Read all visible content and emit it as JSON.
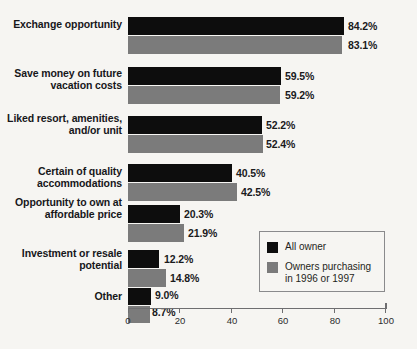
{
  "chart_data": {
    "type": "bar",
    "orientation": "horizontal",
    "title": "",
    "subtitle": "",
    "xlabel": "",
    "ylabel": "",
    "xlim": [
      0,
      100
    ],
    "xticks": [
      "0",
      "20",
      "40",
      "60",
      "80",
      "100"
    ],
    "grid": false,
    "legend_position": "inside-bottom-right",
    "value_suffix": "%",
    "categories": [
      "Exchange\nopportunity",
      "Save money\non future\nvacation costs",
      "Liked resort,\namenities,\nand/or unit",
      "Certain of quality\naccommodations",
      "Opportunity\nto own at\naffordable price",
      "Investment or\nresale potential",
      "Other"
    ],
    "series": [
      {
        "name": "All owner",
        "color": "#0d0d0d",
        "values": [
          84.2,
          59.5,
          52.2,
          40.5,
          20.3,
          12.2,
          9.0
        ],
        "labels": [
          "84.2%",
          "59.5%",
          "52.2%",
          "40.5%",
          "20.3%",
          "12.2%",
          "9.0%"
        ]
      },
      {
        "name": "Owners purchasing\nin 1996 or 1997",
        "color": "#7b7b7b",
        "values": [
          83.1,
          59.2,
          52.4,
          42.5,
          21.9,
          14.8,
          8.7
        ],
        "labels": [
          "83.1%",
          "59.2%",
          "52.4%",
          "42.5%",
          "21.9%",
          "14.8%",
          "8.7%"
        ]
      }
    ]
  },
  "legend": {
    "entries": [
      {
        "label": "All owner",
        "color": "#0d0d0d"
      },
      {
        "label": "Owners purchasing\nin 1996 or 1997",
        "color": "#7b7b7b"
      }
    ]
  },
  "colors": {
    "background": "#f6f5f2",
    "series_all_owner": "#0d0d0d",
    "series_recent_owner": "#7b7b7b",
    "axis": "#6e6e70",
    "text": "#17171a"
  }
}
